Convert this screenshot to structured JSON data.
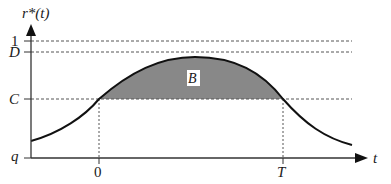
{
  "diagram": {
    "y_axis_label": "r*(t)",
    "x_axis_label": "t",
    "y_levels": [
      {
        "label": "1",
        "y_px": 41
      },
      {
        "label": "D",
        "y_px": 52
      },
      {
        "label": "C",
        "y_px": 99
      },
      {
        "label": "q",
        "y_px": 158
      }
    ],
    "x_ticks": [
      {
        "label": "0",
        "x_px": 99
      },
      {
        "label": "T",
        "x_px": 283
      }
    ],
    "region_label": "B",
    "colors": {
      "curve": "#111111",
      "axes": "#333333",
      "shaded_region": "#888888",
      "dashed": "#555555"
    }
  }
}
